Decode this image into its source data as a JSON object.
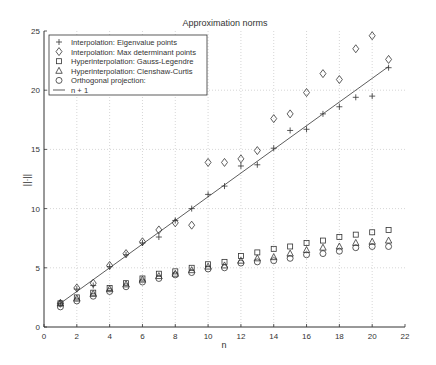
{
  "chart_data": {
    "type": "scatter",
    "title": "Approximation norms",
    "xlabel": "n",
    "ylabel": "||·||",
    "xlim": [
      0,
      22
    ],
    "ylim": [
      0,
      25
    ],
    "xticks": [
      0,
      2,
      4,
      6,
      8,
      10,
      12,
      14,
      16,
      18,
      20,
      22
    ],
    "yticks": [
      0,
      5,
      10,
      15,
      20,
      25
    ],
    "grid": true,
    "legend_position": "upper left",
    "x": [
      1,
      2,
      3,
      4,
      5,
      6,
      7,
      8,
      9,
      10,
      11,
      12,
      13,
      14,
      15,
      16,
      17,
      18,
      19,
      20,
      21
    ],
    "series": [
      {
        "name": "Interpolation: Eigenvalue points",
        "marker": "plus",
        "values": [
          2.0,
          3.2,
          3.5,
          5.1,
          6.1,
          7.1,
          7.6,
          9.0,
          10.0,
          11.2,
          11.9,
          13.6,
          13.7,
          15.1,
          16.6,
          16.7,
          18.0,
          18.6,
          19.4,
          19.5,
          21.9
        ]
      },
      {
        "name": "Interpolation: Max determinant points",
        "marker": "diamond",
        "values": [
          2.0,
          3.3,
          3.7,
          5.2,
          6.2,
          7.2,
          8.2,
          8.8,
          8.6,
          13.9,
          13.9,
          14.2,
          14.9,
          17.6,
          18.0,
          19.8,
          21.4,
          20.9,
          23.5,
          24.6,
          22.6
        ]
      },
      {
        "name": "Hyperinterpolation: Gauss-Legendre",
        "marker": "square",
        "values": [
          2.0,
          2.5,
          2.9,
          3.3,
          3.7,
          4.1,
          4.5,
          4.7,
          5.0,
          5.3,
          5.5,
          6.0,
          6.3,
          6.6,
          6.8,
          7.1,
          7.3,
          7.6,
          7.8,
          8.0,
          8.2
        ]
      },
      {
        "name": "Hyperinterpolation: Clenshaw-Curtis",
        "marker": "triangle",
        "values": [
          2.0,
          2.4,
          2.8,
          3.2,
          3.6,
          4.0,
          4.3,
          4.5,
          4.8,
          5.1,
          5.2,
          5.6,
          5.8,
          5.9,
          6.2,
          6.5,
          6.7,
          6.8,
          7.1,
          7.2,
          7.3
        ]
      },
      {
        "name": "Orthogonal projection:",
        "marker": "circle",
        "values": [
          1.7,
          2.2,
          2.6,
          3.0,
          3.4,
          3.8,
          4.1,
          4.4,
          4.6,
          4.9,
          5.0,
          5.4,
          5.5,
          5.6,
          5.8,
          6.1,
          6.2,
          6.4,
          6.7,
          6.8,
          6.8
        ]
      },
      {
        "name": "n + 1",
        "marker": "line",
        "line_from": [
          1,
          2
        ],
        "line_to": [
          21,
          22
        ]
      }
    ]
  },
  "colors": {
    "axis": "#333333",
    "grid": "#bbbbbb",
    "marker": "#333333",
    "background": "#ffffff"
  }
}
